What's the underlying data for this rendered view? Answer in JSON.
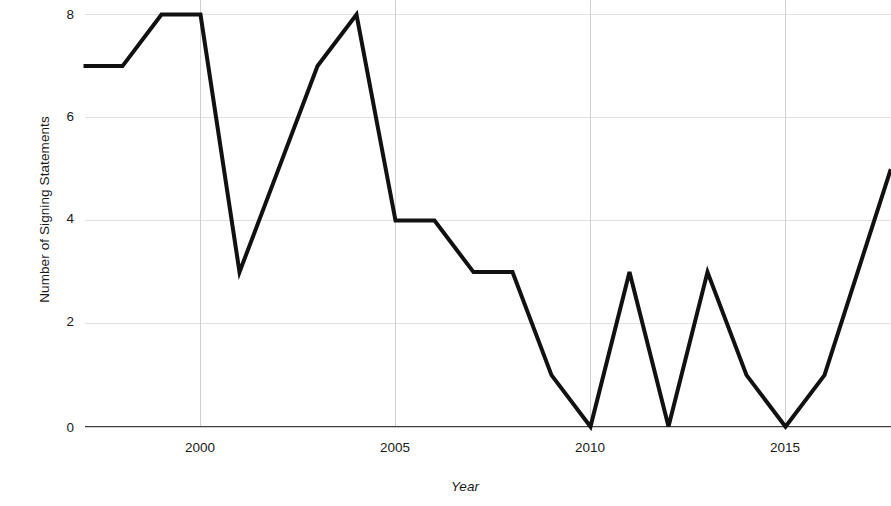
{
  "chart_data": {
    "type": "line",
    "title": "",
    "xlabel": "Year",
    "ylabel": "Number of Signing Statements",
    "xlim": [
      1997,
      1999.73
    ],
    "ylim": [
      0,
      8.27
    ],
    "grid": true,
    "legend": false,
    "legend_position": "none",
    "x_ticks": [
      2000,
      2005,
      2010,
      2015
    ],
    "x_tick_labels": [
      "2000",
      "2005",
      "2010",
      "2015"
    ],
    "y_ticks": [
      0,
      2,
      4,
      6,
      8
    ],
    "y_tick_labels": [
      "0",
      "2",
      "4",
      "6",
      "8"
    ],
    "line_color": "#111111",
    "gridline_color": "#e0e0e0",
    "axis_color": "#3f3f3f",
    "note": "Right side of plot is cropped by the screenshot edge; final visible value is partial.",
    "x": [
      1997,
      1998,
      1999,
      2000,
      2001,
      2002,
      2003,
      2004,
      2005,
      2006,
      2007,
      2008,
      2009,
      2010,
      2011,
      2012,
      2013,
      2014,
      2015,
      2016,
      2017.7
    ],
    "values": [
      7,
      7,
      8,
      8,
      3,
      5,
      7,
      8,
      4,
      4,
      3,
      3,
      1,
      0,
      3,
      0,
      3,
      1,
      0,
      1,
      5
    ],
    "series": [
      {
        "name": "Signing Statements",
        "values": [
          7,
          7,
          8,
          8,
          3,
          5,
          7,
          8,
          4,
          4,
          3,
          3,
          1,
          0,
          3,
          0,
          3,
          1,
          0,
          1,
          5
        ]
      }
    ]
  },
  "axes": {
    "y_title": "Number of Signing Statements",
    "x_title": "Year",
    "y_labels": [
      "8",
      "6",
      "4",
      "2",
      "0"
    ],
    "x_labels": [
      "2000",
      "2005",
      "2010",
      "2015"
    ]
  }
}
